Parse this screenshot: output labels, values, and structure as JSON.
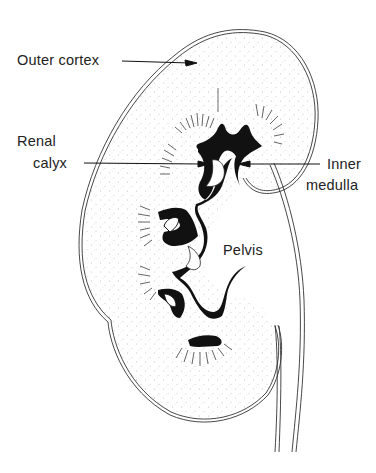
{
  "diagram": {
    "labels": {
      "outer_cortex": "Outer cortex",
      "renal_calyx_line1": "Renal",
      "renal_calyx_line2": "calyx",
      "inner_medulla_line1": "Inner",
      "inner_medulla_line2": "medulla",
      "pelvis": "Pelvis"
    },
    "colors": {
      "background": "#ffffff",
      "ink": "#1a1a1a",
      "stipple": "#555555"
    }
  }
}
